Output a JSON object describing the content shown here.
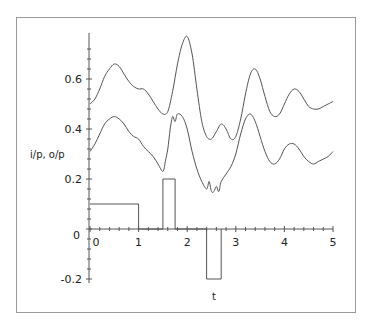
{
  "chart_data": {
    "type": "line",
    "title": "",
    "xlabel": "t",
    "ylabel": "i/p, o/p",
    "xlim": [
      0,
      5
    ],
    "ylim": [
      -0.2,
      0.75
    ],
    "grid": false,
    "legend": null,
    "x_ticks": [
      0,
      1,
      2,
      3,
      4,
      5
    ],
    "x_tick_labels": [
      "0",
      "1",
      "2",
      "3",
      "4",
      "5"
    ],
    "y_ticks": [
      -0.2,
      0,
      0.2,
      0.4,
      0.6
    ],
    "y_tick_labels": [
      "-0.2",
      "0",
      "0.2",
      "0.4",
      "0.6"
    ],
    "series": [
      {
        "name": "output (upper)",
        "x": [
          0,
          0.1,
          0.2,
          0.3,
          0.4,
          0.5,
          0.6,
          0.7,
          0.8,
          0.9,
          1.0,
          1.1,
          1.2,
          1.3,
          1.4,
          1.5,
          1.6,
          1.7,
          1.8,
          1.9,
          2.0,
          2.1,
          2.2,
          2.3,
          2.4,
          2.5,
          2.6,
          2.7,
          2.8,
          2.9,
          3.0,
          3.1,
          3.2,
          3.3,
          3.4,
          3.5,
          3.6,
          3.7,
          3.8,
          3.9,
          4.0,
          4.1,
          4.2,
          4.3,
          4.4,
          4.5,
          4.6,
          4.7,
          4.8,
          4.9,
          5.0
        ],
        "values": [
          0.5,
          0.52,
          0.56,
          0.61,
          0.64,
          0.66,
          0.65,
          0.62,
          0.59,
          0.57,
          0.56,
          0.56,
          0.54,
          0.51,
          0.48,
          0.46,
          0.47,
          0.55,
          0.66,
          0.74,
          0.77,
          0.7,
          0.56,
          0.43,
          0.37,
          0.36,
          0.39,
          0.42,
          0.4,
          0.36,
          0.37,
          0.44,
          0.54,
          0.62,
          0.64,
          0.6,
          0.53,
          0.47,
          0.45,
          0.46,
          0.5,
          0.54,
          0.56,
          0.55,
          0.52,
          0.49,
          0.48,
          0.48,
          0.49,
          0.5,
          0.51
        ]
      },
      {
        "name": "output (lower)",
        "x": [
          0,
          0.1,
          0.2,
          0.3,
          0.4,
          0.5,
          0.6,
          0.7,
          0.8,
          0.9,
          1.0,
          1.1,
          1.2,
          1.3,
          1.4,
          1.5,
          1.55,
          1.6,
          1.65,
          1.7,
          1.75,
          1.8,
          1.9,
          2.0,
          2.1,
          2.2,
          2.3,
          2.4,
          2.45,
          2.5,
          2.55,
          2.6,
          2.65,
          2.7,
          2.8,
          2.9,
          3.0,
          3.1,
          3.2,
          3.3,
          3.4,
          3.5,
          3.6,
          3.7,
          3.8,
          3.9,
          4.0,
          4.1,
          4.2,
          4.3,
          4.4,
          4.5,
          4.6,
          4.7,
          4.8,
          4.9,
          5.0
        ],
        "values": [
          0.31,
          0.34,
          0.38,
          0.42,
          0.44,
          0.45,
          0.44,
          0.42,
          0.39,
          0.37,
          0.36,
          0.33,
          0.31,
          0.29,
          0.26,
          0.23,
          0.27,
          0.32,
          0.4,
          0.45,
          0.43,
          0.46,
          0.45,
          0.4,
          0.31,
          0.24,
          0.19,
          0.16,
          0.19,
          0.15,
          0.15,
          0.17,
          0.15,
          0.19,
          0.22,
          0.25,
          0.3,
          0.38,
          0.44,
          0.46,
          0.43,
          0.37,
          0.31,
          0.27,
          0.26,
          0.28,
          0.32,
          0.34,
          0.34,
          0.32,
          0.29,
          0.27,
          0.26,
          0.27,
          0.28,
          0.29,
          0.31
        ]
      },
      {
        "name": "input pulses",
        "x": [
          0,
          1,
          1,
          1.5,
          1.5,
          1.75,
          1.75,
          2.4,
          2.4,
          2.7,
          2.7
        ],
        "values": [
          0.1,
          0.1,
          0,
          0,
          0.2,
          0.2,
          0,
          0,
          -0.2,
          -0.2,
          0
        ]
      }
    ]
  },
  "labels": {
    "ylabel": "i/p, o/p",
    "xlabel": "t"
  }
}
